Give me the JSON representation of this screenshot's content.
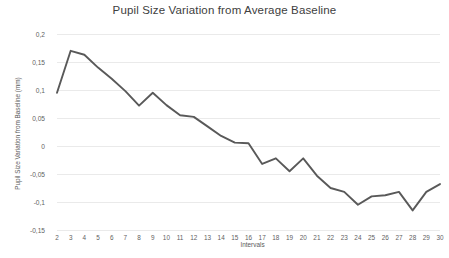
{
  "chart_data": {
    "type": "line",
    "title": "Pupil Size Variation from Average Baseline",
    "xlabel": "Intervals",
    "ylabel": "Pupil Size Variation from Baseline (mm)",
    "x": [
      2,
      3,
      4,
      5,
      6,
      7,
      8,
      9,
      10,
      11,
      12,
      13,
      14,
      15,
      16,
      17,
      18,
      19,
      20,
      21,
      22,
      23,
      24,
      25,
      26,
      27,
      28,
      29,
      30
    ],
    "values": [
      0.095,
      0.17,
      0.163,
      0.14,
      0.12,
      0.098,
      0.072,
      0.095,
      0.073,
      0.055,
      0.052,
      0.035,
      0.018,
      0.006,
      0.005,
      -0.032,
      -0.022,
      -0.045,
      -0.022,
      -0.053,
      -0.075,
      -0.082,
      -0.105,
      -0.09,
      -0.088,
      -0.082,
      -0.115,
      -0.082,
      -0.068
    ],
    "series": [
      {
        "name": "Pupil Size Variation",
        "values": [
          0.095,
          0.17,
          0.163,
          0.14,
          0.12,
          0.098,
          0.072,
          0.095,
          0.073,
          0.055,
          0.052,
          0.035,
          0.018,
          0.006,
          0.005,
          -0.032,
          -0.022,
          -0.045,
          -0.022,
          -0.053,
          -0.075,
          -0.082,
          -0.105,
          -0.09,
          -0.088,
          -0.082,
          -0.115,
          -0.082,
          -0.068
        ]
      }
    ],
    "xtick_labels": [
      "2",
      "3",
      "4",
      "5",
      "6",
      "7",
      "8",
      "9",
      "10",
      "11",
      "12",
      "13",
      "14",
      "15",
      "16",
      "17",
      "18",
      "19",
      "20",
      "21",
      "22",
      "23",
      "24",
      "25",
      "26",
      "27",
      "28",
      "29",
      "30"
    ],
    "ytick_labels": [
      "0,2",
      "0,15",
      "0,1",
      "0,05",
      "0",
      "-0,05",
      "-0,1",
      "-0,15"
    ],
    "ytick_values": [
      0.2,
      0.15,
      0.1,
      0.05,
      0,
      -0.05,
      -0.1,
      -0.15
    ],
    "ylim": [
      -0.15,
      0.2
    ],
    "xlim": [
      2,
      30
    ],
    "grid": "horizontal",
    "legend": "none",
    "line_color": "#595959",
    "grid_color": "#eaeaea",
    "background_color": "#ffffff"
  }
}
